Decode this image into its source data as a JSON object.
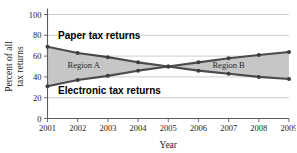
{
  "chart_data": {
    "type": "line",
    "title": "",
    "xlabel": "Year",
    "ylabel": "Percent of all tax returns",
    "ylabel_line1": "Percent of all",
    "ylabel_line2": "tax returns",
    "categories": [
      "2001",
      "2002",
      "2003",
      "2004",
      "2005",
      "2006",
      "2007",
      "2008",
      "2009"
    ],
    "x": [
      2001,
      2002,
      2003,
      2004,
      2005,
      2006,
      2007,
      2008,
      2009
    ],
    "xlim": [
      2001,
      2009
    ],
    "ylim": [
      0,
      100
    ],
    "ytick_values": [
      0,
      20,
      40,
      60,
      80,
      100
    ],
    "ytick_labels": [
      "0",
      "20",
      "40",
      "60",
      "80",
      "100"
    ],
    "grid": true,
    "grid_axis": "y",
    "legend_position": "inline-annotations",
    "series": [
      {
        "name": "Paper tax returns",
        "values": [
          69,
          63,
          59,
          54,
          50,
          46,
          43,
          40,
          38
        ],
        "color": "#4a4a4a"
      },
      {
        "name": "Electronic tax returns",
        "values": [
          31,
          37,
          41,
          46,
          50,
          54,
          58,
          61,
          64
        ],
        "color": "#4a4a4a"
      }
    ],
    "annotations": [
      {
        "id": "paper-label",
        "text": "Paper tax returns",
        "x": 2001.35,
        "y": 76
      },
      {
        "id": "electronic-label",
        "text": "Electronic tax returns",
        "x": 2001.35,
        "y": 24
      },
      {
        "id": "region-a-label",
        "text": "Region A",
        "x": 2002.2,
        "y": 49
      },
      {
        "id": "region-b-label",
        "text": "Region B",
        "x": 2007.0,
        "y": 49
      }
    ],
    "shaded_regions": [
      {
        "id": "region-a",
        "label": "Region A",
        "from_x": 2001,
        "to_x": 2005,
        "fill": "#c6c6c6",
        "description": "Area between paper and electronic curves before the crossover"
      },
      {
        "id": "region-b",
        "label": "Region B",
        "from_x": 2005,
        "to_x": 2009,
        "fill": "#c6c6c6",
        "description": "Area between electronic and paper curves after the crossover"
      }
    ],
    "crossover": {
      "x": 2005,
      "y": 50
    }
  },
  "colors": {
    "line": "#4a4a4a",
    "marker": "#3c3c3c",
    "fill": "#c6c6c6",
    "grid": "#b9b9b9",
    "axis": "#5a5a5a",
    "text": "#222222",
    "background": "#ffffff"
  }
}
